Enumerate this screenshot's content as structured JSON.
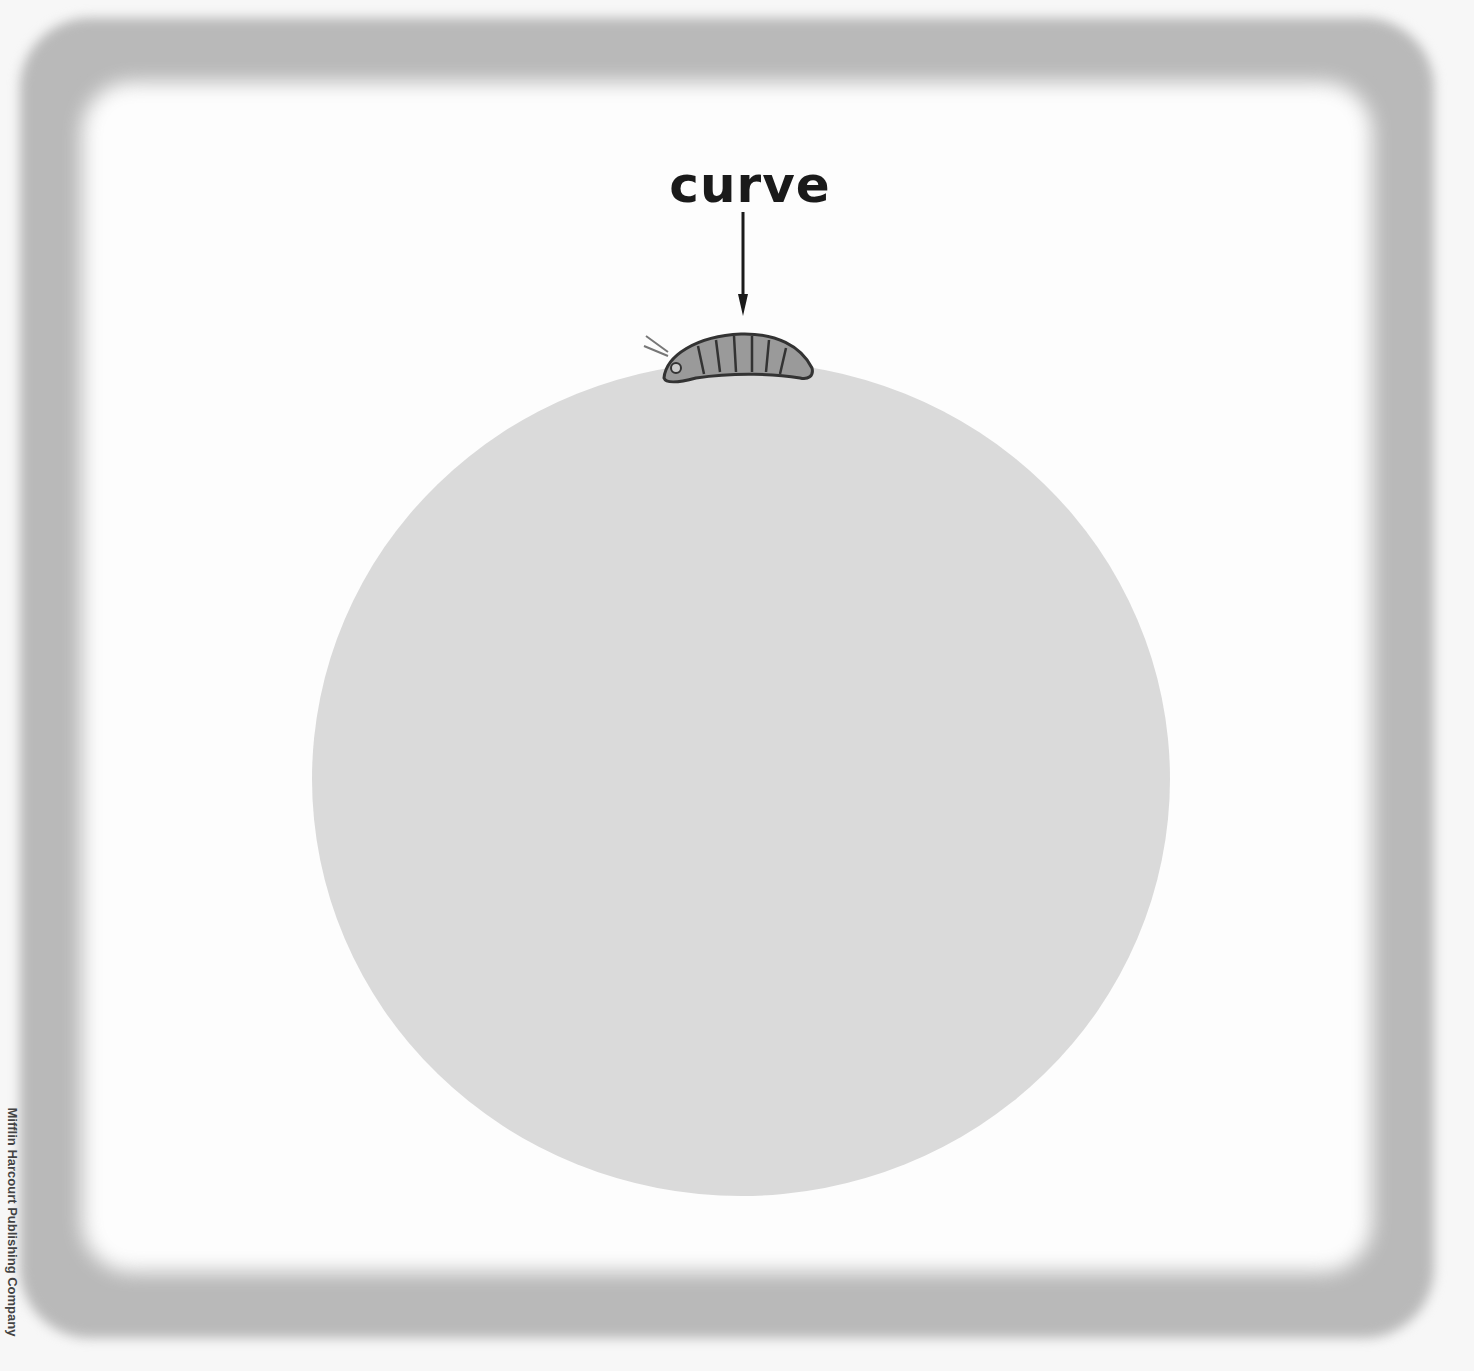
{
  "label": {
    "text": "curve"
  },
  "illustration": {
    "subject": "caterpillar-on-circle",
    "circle_color": "#dadada",
    "frame_color": "#b9b9b9"
  },
  "credit": {
    "text": "Mifflin Harcourt Publishing Company"
  }
}
